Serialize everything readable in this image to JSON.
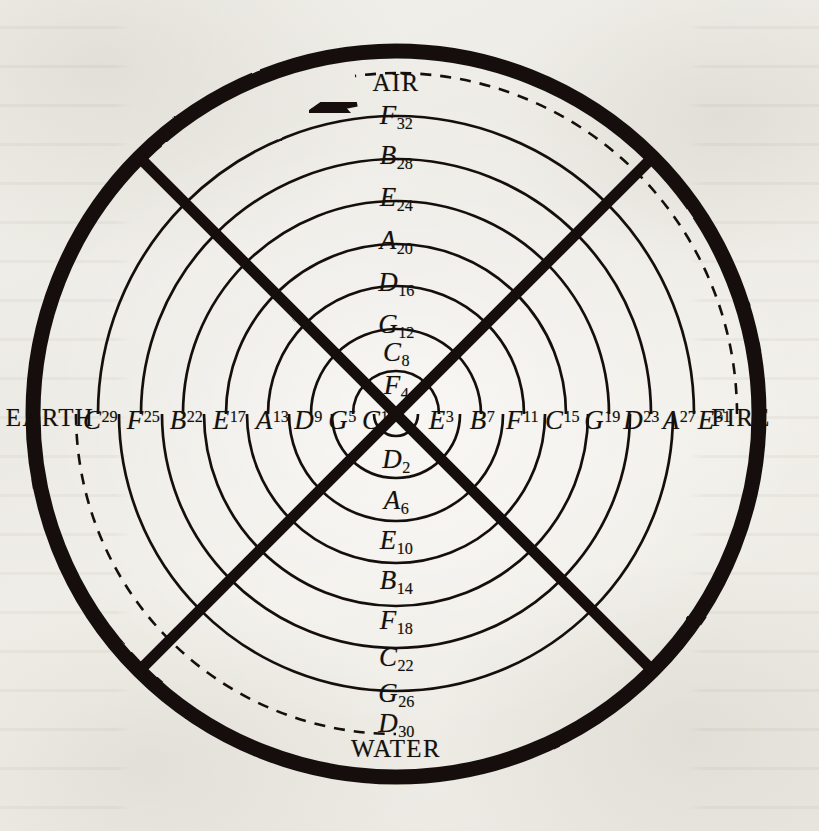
{
  "figure": {
    "background_color": "#efeee9",
    "ink_color": "#14110d",
    "arrow_direction": "left",
    "arrow_name": "direction-of-rotation-arrow"
  },
  "elements": {
    "top": "AIR",
    "right": "FIRE",
    "bottom": "WATER",
    "left": "EARTH"
  },
  "chart_data": {
    "type": "diagram",
    "axis_labels": {
      "top": "AIR",
      "right": "FIRE",
      "bottom": "WATER",
      "left": "EARTH"
    },
    "spiral_turns": 8,
    "total_positions": 32,
    "note_cycle": [
      "C",
      "G",
      "D",
      "A",
      "E",
      "B",
      "F"
    ],
    "arcs_above_axis_are_odd_top_labels": true,
    "outer_arc_style": "dashed",
    "inner_arc_style": "solid",
    "legend_position": "none",
    "grid": false
  },
  "labels": {
    "top_column": [
      {
        "note": "F",
        "num": "32",
        "style": "sub"
      },
      {
        "note": "B",
        "num": "28",
        "style": "sub"
      },
      {
        "note": "E",
        "num": "24",
        "style": "sub"
      },
      {
        "note": "A",
        "num": "20",
        "style": "sub"
      },
      {
        "note": "D",
        "num": "16",
        "style": "sub"
      },
      {
        "note": "G",
        "num": "12",
        "style": "sub"
      },
      {
        "note": "C",
        "num": "8",
        "style": "sub"
      },
      {
        "note": "F",
        "num": "4",
        "style": "sub"
      }
    ],
    "bottom_column": [
      {
        "note": "D",
        "num": "2",
        "style": "sub"
      },
      {
        "note": "A",
        "num": "6",
        "style": "sub"
      },
      {
        "note": "E",
        "num": "10",
        "style": "sub"
      },
      {
        "note": "B",
        "num": "14",
        "style": "sub"
      },
      {
        "note": "F",
        "num": "18",
        "style": "sub"
      },
      {
        "note": "C",
        "num": "22",
        "style": "sub"
      },
      {
        "note": "G",
        "num": "26",
        "style": "sub"
      },
      {
        "note": "D",
        "num": "30",
        "style": "sub"
      }
    ],
    "left_row": [
      {
        "note": "C",
        "num": "29",
        "style": "sup"
      },
      {
        "note": "F",
        "num": "25",
        "style": "sup"
      },
      {
        "note": "B",
        "num": "22",
        "style": "sup"
      },
      {
        "note": "E",
        "num": "17",
        "style": "sup"
      },
      {
        "note": "A",
        "num": "13",
        "style": "sup"
      },
      {
        "note": "D",
        "num": "9",
        "style": "sup"
      },
      {
        "note": "G",
        "num": "5",
        "style": "sup"
      },
      {
        "note": "C",
        "num": "1",
        "style": "sup"
      }
    ],
    "right_row": [
      {
        "note": "E",
        "num": "3",
        "style": "sup"
      },
      {
        "note": "B",
        "num": "7",
        "style": "sup"
      },
      {
        "note": "F",
        "num": "11",
        "style": "sup"
      },
      {
        "note": "C",
        "num": "15",
        "style": "sup"
      },
      {
        "note": "G",
        "num": "19",
        "style": "sup"
      },
      {
        "note": "D",
        "num": "23",
        "style": "sup"
      },
      {
        "note": "A",
        "num": "27",
        "style": "sup"
      },
      {
        "note": "E",
        "num": "31",
        "style": "sup"
      }
    ]
  }
}
